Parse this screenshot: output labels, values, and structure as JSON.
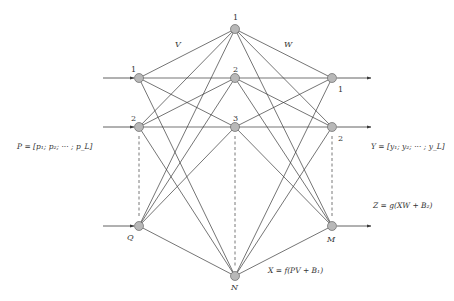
{
  "diagram": {
    "colors": {
      "node_fill": "#b8b8b8",
      "node_stroke": "#555555",
      "line": "#3a3a3a",
      "text": "#333333",
      "background": "#ffffff"
    },
    "layers": {
      "input": {
        "x": 139,
        "nodes": [
          {
            "id": "1",
            "label": "1",
            "y": 78
          },
          {
            "id": "2",
            "label": "2",
            "y": 127
          },
          {
            "id": "Q",
            "label": "Q",
            "y": 226
          }
        ]
      },
      "hidden": {
        "x": 235,
        "nodes": [
          {
            "id": "1",
            "label": "1",
            "y": 29
          },
          {
            "id": "2",
            "label": "2",
            "y": 78
          },
          {
            "id": "3",
            "label": "3",
            "y": 127
          },
          {
            "id": "N",
            "label": "N",
            "y": 276
          }
        ]
      },
      "output": {
        "x": 332,
        "nodes": [
          {
            "id": "1",
            "label": "1",
            "y": 78
          },
          {
            "id": "2",
            "label": "2",
            "y": 127
          },
          {
            "id": "M",
            "label": "M",
            "y": 226
          }
        ]
      }
    },
    "weights": {
      "input_to_hidden": "V",
      "hidden_to_output": "W"
    },
    "formulas": {
      "input_vector": "P = [p₁; p₂; ··· ; p_L]",
      "output_vector": "Y = [y₁; y₂; ··· ; y_L]",
      "output_function": "Z = g(XW + B₂)",
      "hidden_function": "X = f(PV + B₁)"
    },
    "labels": {
      "in1": "1",
      "in2": "2",
      "inQ": "Q",
      "h1": "1",
      "h2": "2",
      "h3": "3",
      "hN": "N",
      "out1": "1",
      "out2": "2",
      "outM": "M",
      "V": "V",
      "W": "W"
    }
  }
}
